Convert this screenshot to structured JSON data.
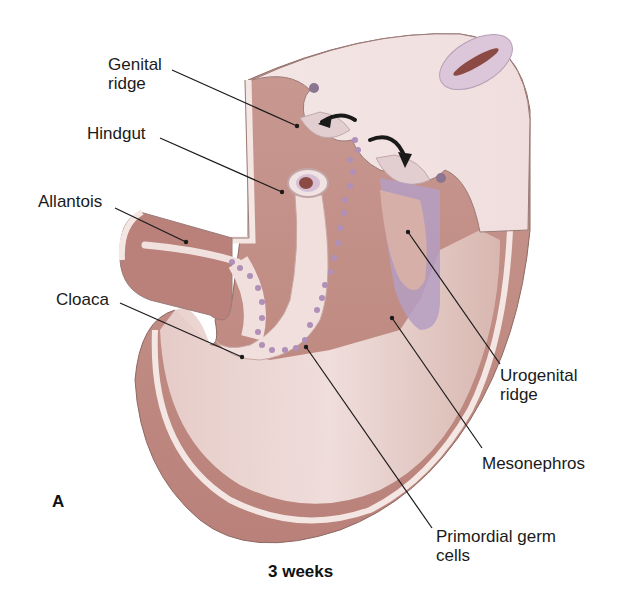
{
  "figure": {
    "panel_letter": "A",
    "caption": "3 weeks",
    "labels": [
      {
        "id": "genital-ridge",
        "text": "Genital\nridge"
      },
      {
        "id": "hindgut",
        "text": "Hindgut"
      },
      {
        "id": "allantois",
        "text": "Allantois"
      },
      {
        "id": "cloaca",
        "text": "Cloaca"
      },
      {
        "id": "urogenital-ridge",
        "text": "Urogenital\nridge"
      },
      {
        "id": "mesonephros",
        "text": "Mesonephros"
      },
      {
        "id": "primordial-germ-cells",
        "text": "Primordial germ\ncells"
      }
    ]
  },
  "colors": {
    "tissue_light": "#f3e4e4",
    "tissue_mid": "#d7b3ac",
    "tissue_dark": "#a46e66",
    "cavity": "#8b4a44",
    "mesonephros": "#b6a0c4",
    "germ_cells": "#b08fb8",
    "leader_line": "#1a1a1a"
  }
}
